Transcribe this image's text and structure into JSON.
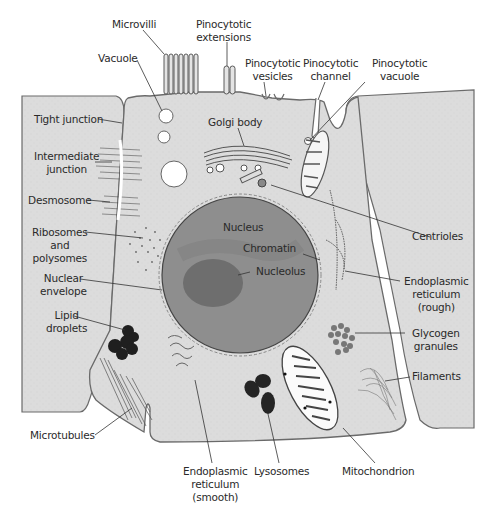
{
  "colors": {
    "cytoplasm": "#dcdcdc",
    "membrane": "#6a6a6a",
    "nucleus": "#8c8c8c",
    "nucleolus": "#6e6e6e",
    "organelle_dark": "#222222",
    "label_text": "#2a2a2a",
    "background": "#ffffff"
  },
  "labels": {
    "microvilli": "Microvilli",
    "pinocytotic_extensions": [
      "Pinocytotic",
      "extensions"
    ],
    "vacuole": "Vacuole",
    "pinocytotic_vesicles": [
      "Pinocytotic",
      "vesicles"
    ],
    "pinocytotic_channel": [
      "Pinocytotic",
      "channel"
    ],
    "pinocytotic_vacuole": [
      "Pinocytotic",
      "vacuole"
    ],
    "tight_junction": "Tight junction",
    "golgi_body": "Golgi body",
    "intermediate_junction": [
      "Intermediate",
      "junction"
    ],
    "desmosome": "Desmosome",
    "ribosomes": [
      "Ribosomes",
      "and",
      "polysomes"
    ],
    "nucleus": "Nucleus",
    "chromatin": "Chromatin",
    "nucleolus": "Nucleolus",
    "centrioles": "Centrioles",
    "nuclear_envelope": [
      "Nuclear",
      "envelope"
    ],
    "er_rough": [
      "Endoplasmic",
      "reticulum",
      "(rough)"
    ],
    "lipid_droplets": [
      "Lipid",
      "droplets"
    ],
    "glycogen_granules": [
      "Glycogen",
      "granules"
    ],
    "filaments": "Filaments",
    "microtubules": "Microtubules",
    "er_smooth": [
      "Endoplasmic",
      "reticulum",
      "(smooth)"
    ],
    "lysosomes": "Lysosomes",
    "mitochondrion": "Mitochondrion"
  }
}
